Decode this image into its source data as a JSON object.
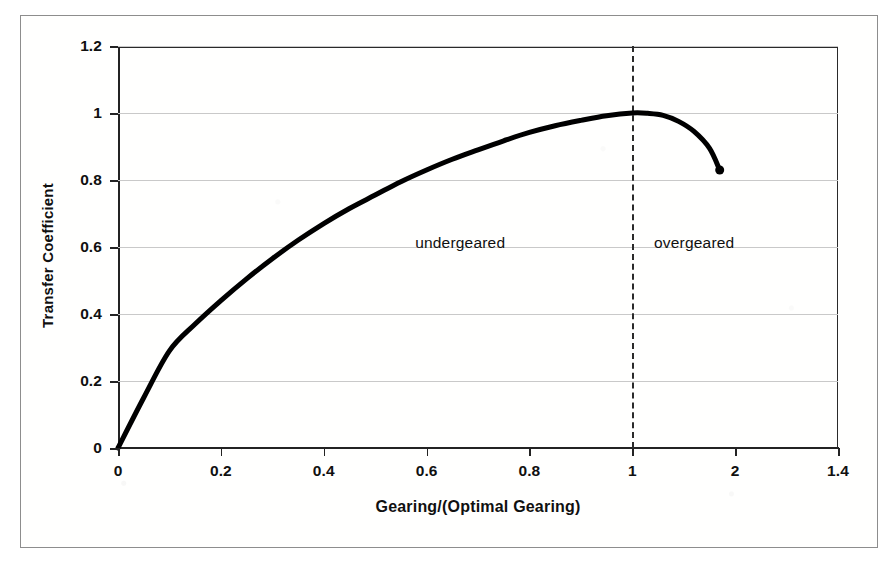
{
  "figure": {
    "border_color": "#8d8d8d",
    "background": "#ffffff"
  },
  "chart_data": {
    "type": "line",
    "title": "",
    "subtitle": "",
    "xlabel": "Gearing/(Optimal Gearing)",
    "ylabel": "Transfer Coefficient",
    "xlim": [
      0,
      1.4
    ],
    "ylim": [
      0,
      1.2
    ],
    "xticks": [
      0,
      0.2,
      0.4,
      0.6,
      0.8,
      1,
      1.2,
      1.4
    ],
    "xtick_labels": [
      "0",
      "0.2",
      "0.4",
      "0.6",
      "0.8",
      "1",
      "2",
      "1.4"
    ],
    "yticks": [
      0,
      0.2,
      0.4,
      0.6,
      0.8,
      1,
      1.2
    ],
    "ytick_labels": [
      "0",
      "0.2",
      "0.4",
      "0.6",
      "0.8",
      "1",
      "1.2"
    ],
    "grid": "horizontal",
    "legend": "none",
    "line_color": "#000000",
    "line_width": 5,
    "series": [
      {
        "name": "transfer coefficient",
        "x": [
          0.0,
          0.05,
          0.1,
          0.15,
          0.2,
          0.25,
          0.3,
          0.35,
          0.4,
          0.45,
          0.5,
          0.55,
          0.6,
          0.65,
          0.7,
          0.75,
          0.8,
          0.85,
          0.9,
          0.95,
          1.0,
          1.03,
          1.06,
          1.09,
          1.12,
          1.15,
          1.17
        ],
        "y": [
          0.0,
          0.15,
          0.29,
          0.37,
          0.44,
          0.505,
          0.565,
          0.62,
          0.67,
          0.715,
          0.755,
          0.795,
          0.83,
          0.862,
          0.89,
          0.917,
          0.942,
          0.962,
          0.978,
          0.992,
          1.0,
          0.999,
          0.993,
          0.975,
          0.945,
          0.895,
          0.83
        ],
        "marker_end": {
          "x": 1.17,
          "y": 0.83,
          "shape": "circle",
          "size": 9
        }
      }
    ],
    "annotations": [
      {
        "text": "undergeared",
        "x": 0.78,
        "y": 0.61,
        "align": "right-of-center"
      },
      {
        "text": "overgeared",
        "x": 1.12,
        "y": 0.61,
        "align": "left-of-center"
      }
    ],
    "reference_lines": [
      {
        "orientation": "vertical",
        "x": 1.0,
        "style": "dashed",
        "color": "#2b2b2b",
        "label": ""
      }
    ]
  }
}
